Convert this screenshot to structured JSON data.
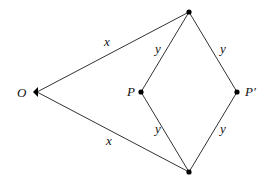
{
  "diagram": {
    "title": "",
    "stroke_color": "#333333",
    "point_color": "#000000",
    "points": {
      "O": {
        "x": 37,
        "y": 92,
        "label": "O",
        "lx": 17,
        "ly": 97
      },
      "top": {
        "x": 189,
        "y": 12,
        "label": ""
      },
      "bottom": {
        "x": 189,
        "y": 172,
        "label": ""
      },
      "P": {
        "x": 141,
        "y": 92,
        "label": "P",
        "lx": 127,
        "ly": 96
      },
      "Pprime": {
        "x": 237,
        "y": 92,
        "label": "P′",
        "lx": 245,
        "ly": 96
      }
    },
    "edges": [
      {
        "from": "O",
        "to": "top",
        "label": "x",
        "lx": 104,
        "ly": 46
      },
      {
        "from": "O",
        "to": "bottom",
        "label": "x",
        "lx": 106,
        "ly": 145
      },
      {
        "from": "top",
        "to": "P",
        "label": "y",
        "lx": 155,
        "ly": 53
      },
      {
        "from": "top",
        "to": "Pprime",
        "label": "y",
        "lx": 220,
        "ly": 53
      },
      {
        "from": "P",
        "to": "bottom",
        "label": "y",
        "lx": 155,
        "ly": 133
      },
      {
        "from": "Pprime",
        "to": "bottom",
        "label": "y",
        "lx": 220,
        "ly": 133
      }
    ]
  }
}
